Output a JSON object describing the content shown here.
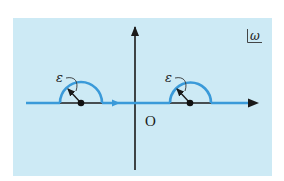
{
  "figure": {
    "plane_label": "ω",
    "origin_label": "O",
    "epsilon_labels": [
      "ε",
      "ε"
    ],
    "colors": {
      "panel_background": "#cdeaf5",
      "contour": "#3a9ad9",
      "axis": "#1a1a1a",
      "pole": "#111111"
    },
    "poles": [
      {
        "name": "left-pole",
        "side": "negative real axis"
      },
      {
        "name": "right-pole",
        "side": "positive real axis"
      }
    ],
    "contour_direction": "left-to-right along real axis, passing above poles"
  }
}
